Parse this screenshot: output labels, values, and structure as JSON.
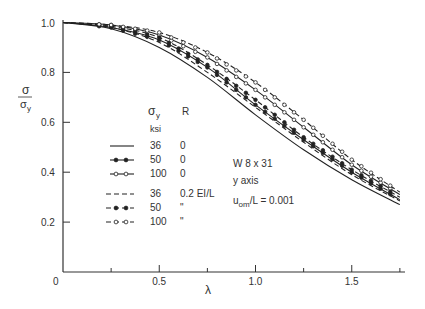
{
  "chart_data": {
    "type": "line",
    "title": "",
    "xlabel": "λ",
    "ylabel": "σ/σy",
    "xlim": [
      0,
      1.75
    ],
    "ylim": [
      0,
      1.0
    ],
    "x_ticks": [
      0,
      0.25,
      0.5,
      0.75,
      1.0,
      1.25,
      1.5,
      1.75
    ],
    "x_tick_labels": [
      "0",
      "0.5",
      "1.0",
      "1.5"
    ],
    "y_tick_labels": [
      "0.2",
      "0.4",
      "0.6",
      "0.8",
      "1.0"
    ],
    "grid": false,
    "x": [
      0,
      0.25,
      0.5,
      0.75,
      1.0,
      1.25,
      1.5,
      1.75
    ],
    "series": [
      {
        "name": "σy=36 ksi, R=0",
        "style": "solid",
        "marker": "none",
        "values": [
          1.0,
          0.975,
          0.9,
          0.78,
          0.63,
          0.49,
          0.37,
          0.27
        ]
      },
      {
        "name": "σy=50 ksi, R=0",
        "style": "solid",
        "marker": "filled-circle",
        "values": [
          1.0,
          0.98,
          0.93,
          0.82,
          0.67,
          0.53,
          0.4,
          0.29
        ]
      },
      {
        "name": "σy=100 ksi, R=0",
        "style": "solid",
        "marker": "open-circle",
        "values": [
          1.0,
          0.99,
          0.95,
          0.86,
          0.73,
          0.58,
          0.43,
          0.31
        ]
      },
      {
        "name": "σy=36 ksi, R=0.2EI/L",
        "style": "dashed",
        "marker": "none",
        "values": [
          1.0,
          0.98,
          0.92,
          0.8,
          0.66,
          0.52,
          0.39,
          0.285
        ]
      },
      {
        "name": "σy=50 ksi, R=0.2EI/L",
        "style": "dashed",
        "marker": "filled-circle",
        "values": [
          1.0,
          0.985,
          0.94,
          0.83,
          0.69,
          0.54,
          0.41,
          0.3
        ]
      },
      {
        "name": "σy=100 ksi, R=0.2EI/L",
        "style": "dashed",
        "marker": "open-circle",
        "values": [
          1.0,
          0.99,
          0.96,
          0.88,
          0.76,
          0.61,
          0.45,
          0.32
        ]
      }
    ],
    "legend": {
      "header_sigma": "σy",
      "header_R": "R",
      "units": "ksi",
      "rows": [
        {
          "sigma": "36",
          "R": "0"
        },
        {
          "sigma": "50",
          "R": "0"
        },
        {
          "sigma": "100",
          "R": "0"
        },
        {
          "sigma": "36",
          "R": "0.2 EI/L"
        },
        {
          "sigma": "50",
          "R": "\""
        },
        {
          "sigma": "100",
          "R": "\""
        }
      ]
    },
    "annotations": [
      "W 8 x 31",
      "y axis",
      "uom/L = 0.001"
    ]
  },
  "labels": {
    "origin": "0",
    "x_axis": "λ",
    "y_axis_num": "σ",
    "y_axis_den": "σy",
    "section": "W 8 x 31",
    "axis": "y  axis",
    "imperfection_u": "u",
    "imperfection_sub": "om",
    "imperfection_rest": "/L = 0.001"
  },
  "colors": {
    "ink": "#222222",
    "background": "#ffffff"
  }
}
